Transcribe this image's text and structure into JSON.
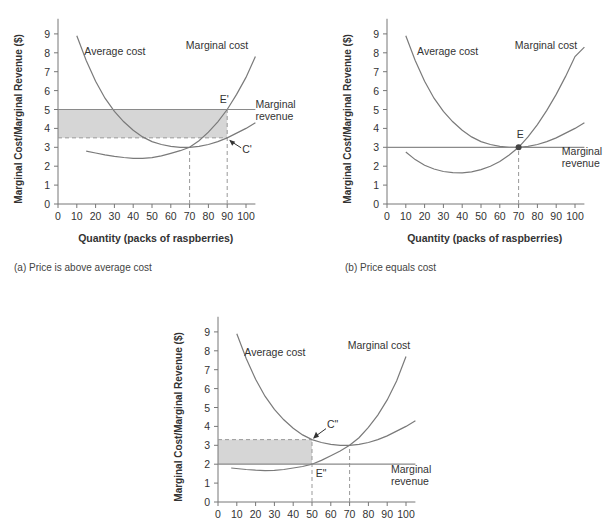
{
  "chart_data": [
    {
      "id": "a",
      "type": "line",
      "caption": "(a) Price is above average cost",
      "xlabel": "Quantity (packs of raspberries)",
      "ylabel": "Marginal Cost/Marginal Revenue ($)",
      "xlim": [
        0,
        105
      ],
      "ylim": [
        0,
        9.8
      ],
      "xticks": [
        0,
        10,
        20,
        30,
        40,
        50,
        60,
        70,
        80,
        90,
        100
      ],
      "yticks": [
        0,
        1,
        2,
        3,
        4,
        5,
        6,
        7,
        8,
        9
      ],
      "series": [
        {
          "name": "Average cost",
          "x": [
            10,
            15,
            20,
            25,
            30,
            35,
            40,
            45,
            50,
            55,
            60,
            65,
            70,
            75,
            80,
            85,
            90,
            95,
            100,
            105
          ],
          "values": [
            8.9,
            7.6,
            6.5,
            5.6,
            4.9,
            4.35,
            3.9,
            3.55,
            3.3,
            3.15,
            3.05,
            3.0,
            3.0,
            3.05,
            3.15,
            3.3,
            3.5,
            3.75,
            4.0,
            4.3
          ]
        },
        {
          "name": "Marginal cost",
          "x": [
            15,
            20,
            25,
            30,
            35,
            40,
            45,
            50,
            55,
            60,
            65,
            70,
            75,
            80,
            85,
            90,
            95,
            100,
            105
          ],
          "values": [
            2.8,
            2.7,
            2.6,
            2.52,
            2.46,
            2.42,
            2.42,
            2.45,
            2.55,
            2.68,
            2.82,
            3.0,
            3.35,
            3.8,
            4.35,
            5.0,
            5.8,
            6.7,
            7.8
          ]
        },
        {
          "name": "Marginal revenue",
          "x": [
            0,
            105
          ],
          "values": [
            5,
            5
          ]
        }
      ],
      "shaded_region": {
        "x": [
          0,
          90
        ],
        "y": [
          3.5,
          5
        ]
      },
      "dashed_lines": [
        {
          "x": [
            70,
            70
          ],
          "y": [
            0,
            3
          ]
        },
        {
          "x": [
            90,
            90
          ],
          "y": [
            0,
            5
          ]
        },
        {
          "x": [
            0,
            90
          ],
          "y": [
            3.5,
            3.5
          ]
        }
      ],
      "annotations": [
        {
          "text": "Average cost",
          "x": 14,
          "y": 7.9
        },
        {
          "text": "Marginal cost",
          "x": 68,
          "y": 8.2
        },
        {
          "text": "E'",
          "x": 86,
          "y": 5.35
        },
        {
          "text": "Marginal",
          "x": 105,
          "y": 5.1
        },
        {
          "text": "revenue",
          "x": 105,
          "y": 4.45
        },
        {
          "text": "C'",
          "x": 98,
          "y": 2.7
        }
      ],
      "points": {
        "E'": [
          90,
          5
        ],
        "C'": [
          90,
          3.5
        ]
      }
    },
    {
      "id": "b",
      "type": "line",
      "caption": "(b) Price equals cost",
      "xlabel": "Quantity (packs of raspberries)",
      "ylabel": "Marginal Cost/Marginal Revenue ($)",
      "xlim": [
        0,
        105
      ],
      "ylim": [
        0,
        9.8
      ],
      "xticks": [
        0,
        10,
        20,
        30,
        40,
        50,
        60,
        70,
        80,
        90,
        100
      ],
      "yticks": [
        0,
        1,
        2,
        3,
        4,
        5,
        6,
        7,
        8,
        9
      ],
      "series": [
        {
          "name": "Average cost",
          "x": [
            10,
            15,
            20,
            25,
            30,
            35,
            40,
            45,
            50,
            55,
            60,
            65,
            70,
            75,
            80,
            85,
            90,
            95,
            100,
            105
          ],
          "values": [
            8.9,
            7.6,
            6.5,
            5.6,
            4.9,
            4.35,
            3.9,
            3.55,
            3.3,
            3.15,
            3.05,
            3.0,
            3.0,
            3.05,
            3.15,
            3.3,
            3.5,
            3.75,
            4.0,
            4.3
          ]
        },
        {
          "name": "Marginal cost",
          "x": [
            10,
            15,
            20,
            25,
            30,
            35,
            40,
            45,
            50,
            55,
            60,
            65,
            70,
            75,
            80,
            85,
            90,
            95,
            100,
            105
          ],
          "values": [
            2.75,
            2.35,
            2.05,
            1.85,
            1.72,
            1.66,
            1.65,
            1.7,
            1.82,
            2.0,
            2.25,
            2.6,
            3.0,
            3.55,
            4.2,
            4.95,
            5.8,
            6.75,
            7.8,
            8.3
          ]
        },
        {
          "name": "Marginal revenue",
          "x": [
            0,
            105
          ],
          "values": [
            3,
            3
          ]
        }
      ],
      "dashed_lines": [
        {
          "x": [
            70,
            70
          ],
          "y": [
            0,
            3
          ]
        }
      ],
      "annotations": [
        {
          "text": "Average cost",
          "x": 16,
          "y": 7.9
        },
        {
          "text": "Marginal cost",
          "x": 68,
          "y": 8.2
        },
        {
          "text": "E",
          "x": 69,
          "y": 3.5
        },
        {
          "text": "Marginal",
          "x": 93,
          "y": 2.6
        },
        {
          "text": "revenue",
          "x": 93,
          "y": 1.95
        }
      ],
      "points": {
        "E": [
          70,
          3
        ]
      }
    },
    {
      "id": "c",
      "type": "line",
      "caption": "",
      "xlabel": "",
      "ylabel": "Marginal Cost/Marginal Revenue ($)",
      "xlim": [
        0,
        105
      ],
      "ylim": [
        0,
        9.8
      ],
      "xticks": [
        0,
        10,
        20,
        30,
        40,
        50,
        60,
        70,
        80,
        90,
        100
      ],
      "yticks": [
        0,
        1,
        2,
        3,
        4,
        5,
        6,
        7,
        8,
        9
      ],
      "series": [
        {
          "name": "Average cost",
          "x": [
            10,
            15,
            20,
            25,
            30,
            35,
            40,
            45,
            50,
            55,
            60,
            65,
            70,
            75,
            80,
            85,
            90,
            95,
            100,
            105
          ],
          "values": [
            8.9,
            7.6,
            6.5,
            5.6,
            4.9,
            4.35,
            3.9,
            3.55,
            3.3,
            3.15,
            3.05,
            3.0,
            3.0,
            3.05,
            3.15,
            3.3,
            3.5,
            3.75,
            4.0,
            4.3
          ]
        },
        {
          "name": "Marginal cost",
          "x": [
            7,
            15,
            20,
            25,
            30,
            35,
            40,
            45,
            50,
            55,
            60,
            65,
            70,
            75,
            80,
            85,
            90,
            95,
            100
          ],
          "values": [
            1.8,
            1.72,
            1.68,
            1.66,
            1.67,
            1.72,
            1.8,
            1.88,
            2.0,
            2.2,
            2.45,
            2.7,
            3.0,
            3.4,
            3.95,
            4.6,
            5.4,
            6.4,
            7.7
          ]
        },
        {
          "name": "Marginal revenue",
          "x": [
            0,
            105
          ],
          "values": [
            2,
            2
          ]
        }
      ],
      "shaded_region": {
        "x": [
          0,
          50
        ],
        "y": [
          2,
          3.3
        ]
      },
      "dashed_lines": [
        {
          "x": [
            50,
            50
          ],
          "y": [
            0,
            3.3
          ]
        },
        {
          "x": [
            70,
            70
          ],
          "y": [
            0,
            3
          ]
        },
        {
          "x": [
            0,
            50
          ],
          "y": [
            3.3,
            3.3
          ]
        }
      ],
      "annotations": [
        {
          "text": "Average cost",
          "x": 14,
          "y": 7.7
        },
        {
          "text": "Marginal cost",
          "x": 69,
          "y": 8.1
        },
        {
          "text": "C\"",
          "x": 58,
          "y": 3.9
        },
        {
          "text": "E\"",
          "x": 52,
          "y": 1.3
        },
        {
          "text": "Marginal",
          "x": 92,
          "y": 1.55
        },
        {
          "text": "revenue",
          "x": 92,
          "y": 0.9
        }
      ],
      "points": {
        "E\"": [
          50,
          2
        ],
        "C\"": [
          50,
          3.3
        ]
      }
    }
  ],
  "colors": {
    "axis": "#777777",
    "curve": "#7a7a7a",
    "mr_line": "#8a8a8a",
    "shade": "#d6d6d6",
    "dashed": "#999999",
    "text": "#333333",
    "point": "#444444"
  }
}
